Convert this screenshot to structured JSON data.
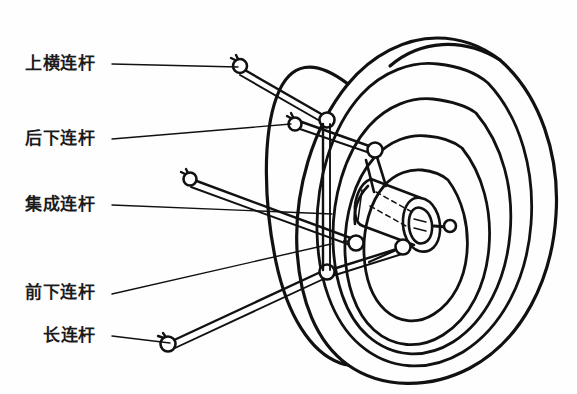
{
  "figure": {
    "background_color": "#fefefe",
    "line_color": "#111111",
    "text_color": "#1b1b1b"
  },
  "callouts": [
    {
      "id": "upper-transverse-link",
      "label": "上横连杆",
      "leader": {
        "x1": 112,
        "y1": 64,
        "x2": 238,
        "y2": 67
      }
    },
    {
      "id": "rear-lower-link",
      "label": "后下连杆",
      "leader": {
        "x1": 112,
        "y1": 139,
        "x2": 291,
        "y2": 124
      }
    },
    {
      "id": "integrated-link",
      "label": "集成连杆",
      "leader": {
        "x1": 112,
        "y1": 205,
        "x2": 332,
        "y2": 214
      }
    },
    {
      "id": "front-lower-link",
      "label": "前下连杆",
      "leader": {
        "x1": 112,
        "y1": 294,
        "x2": 331,
        "y2": 244
      }
    },
    {
      "id": "long-link",
      "label": "长连杆",
      "leader": {
        "x1": 112,
        "y1": 336,
        "x2": 170,
        "y2": 343
      }
    }
  ],
  "components": [
    {
      "id": "tire",
      "label": "轮胎"
    },
    {
      "id": "wheel-rim",
      "label": "轮辋"
    },
    {
      "id": "hub-knuckle",
      "label": "转向节/轮毂"
    },
    {
      "id": "hub-stub-arm",
      "label": "轮毂短臂"
    },
    {
      "id": "vertical-strut",
      "label": "竖向支柱"
    }
  ],
  "joints": [
    {
      "id": "joint-upper-free",
      "x": 240,
      "y": 66
    },
    {
      "id": "joint-rear-free",
      "x": 295,
      "y": 124
    },
    {
      "id": "joint-upper-inner",
      "x": 327,
      "y": 120
    },
    {
      "id": "joint-rear-inner",
      "x": 375,
      "y": 150
    },
    {
      "id": "joint-integrated-free",
      "x": 190,
      "y": 179
    },
    {
      "id": "joint-integrated-inner",
      "x": 356,
      "y": 243
    },
    {
      "id": "joint-front-lower",
      "x": 403,
      "y": 247
    },
    {
      "id": "joint-long-inner",
      "x": 327,
      "y": 272
    },
    {
      "id": "joint-long-free",
      "x": 168,
      "y": 344
    },
    {
      "id": "joint-hub-stub",
      "x": 450,
      "y": 225
    }
  ]
}
